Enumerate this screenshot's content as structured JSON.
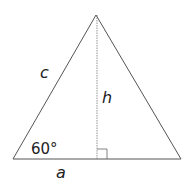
{
  "diagram": {
    "type": "geometry",
    "shape": "triangle",
    "labels": {
      "side_left": "c",
      "height": "h",
      "base": "a",
      "angle": "60°"
    },
    "colors": {
      "stroke": "#555555",
      "text": "#222222"
    }
  }
}
